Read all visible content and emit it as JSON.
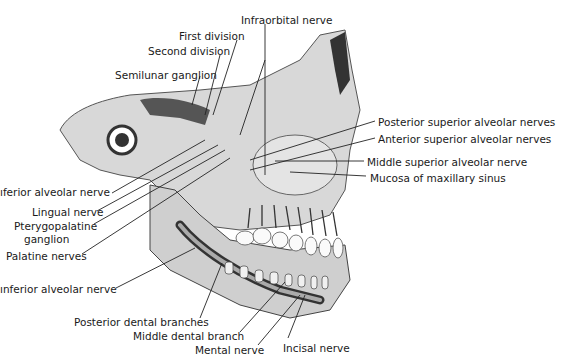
{
  "figure": {
    "labels": [
      {
        "id": "infraorbital-nerve",
        "text": "Infraorbital nerve",
        "x": 241,
        "y": 14
      },
      {
        "id": "first-division",
        "text": "First division",
        "x": 179,
        "y": 30
      },
      {
        "id": "second-division",
        "text": "Second division",
        "x": 148,
        "y": 45
      },
      {
        "id": "semilunar-ganglion",
        "text": "Semilunar ganglion",
        "x": 115,
        "y": 69
      },
      {
        "id": "posterior-superior-alveolar-nerves",
        "text": "Posterior superior alveolar nerves",
        "x": 378,
        "y": 116
      },
      {
        "id": "anterior-superior-alveolar-nerves",
        "text": "Anterior superior alveolar nerves",
        "x": 378,
        "y": 133
      },
      {
        "id": "middle-superior-alveolar-nerve",
        "text": "Middle superior alveolar nerve",
        "x": 367,
        "y": 156
      },
      {
        "id": "mucosa-of-maxillary-sinus",
        "text": "Mucosa of maxillary sinus",
        "x": 370,
        "y": 172
      },
      {
        "id": "inferior-alveolar-nerve-upper",
        "text": "ıferior alveolar nerve",
        "x": 0,
        "y": 186
      },
      {
        "id": "lingual-nerve",
        "text": "Lingual nerve",
        "x": 32,
        "y": 206
      },
      {
        "id": "pterygopalatine-ganglion-line1",
        "text": "Pterygopalatine",
        "x": 14,
        "y": 220
      },
      {
        "id": "pterygopalatine-ganglion-line2",
        "text": "ganglion",
        "x": 24,
        "y": 233
      },
      {
        "id": "palatine-nerves",
        "text": "Palatine nerves",
        "x": 6,
        "y": 250
      },
      {
        "id": "inferior-alveolar-nerve-lower",
        "text": "ınferior alveolar nerve",
        "x": 0,
        "y": 283
      },
      {
        "id": "posterior-dental-branches",
        "text": "Posterior dental branches",
        "x": 74,
        "y": 316
      },
      {
        "id": "middle-dental-branch",
        "text": "Middle dental branch",
        "x": 133,
        "y": 330
      },
      {
        "id": "mental-nerve",
        "text": "Mental nerve",
        "x": 195,
        "y": 344
      },
      {
        "id": "incisal-nerve",
        "text": "Incisal nerve",
        "x": 283,
        "y": 342
      }
    ]
  }
}
